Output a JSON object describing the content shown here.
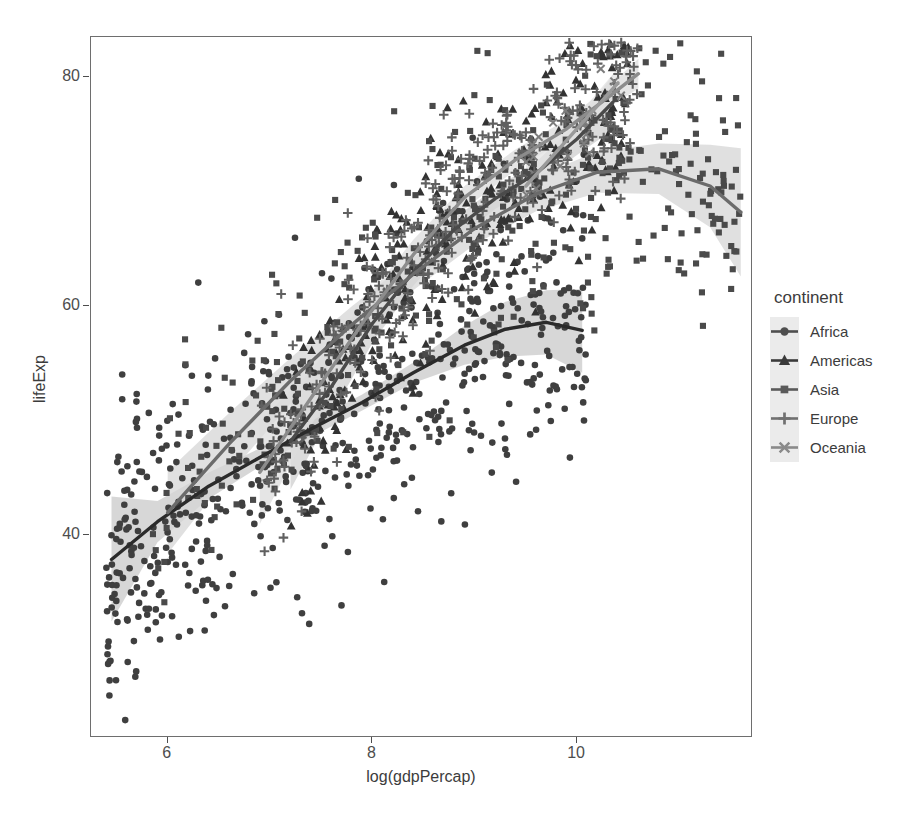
{
  "chart_data": {
    "type": "scatter",
    "title": "",
    "xlabel": "log(gdpPercap)",
    "ylabel": "lifeExp",
    "xlim": [
      5.25,
      11.7
    ],
    "ylim": [
      22.5,
      83.5
    ],
    "xticks": [
      6,
      8,
      10
    ],
    "yticks": [
      40,
      60,
      80
    ],
    "grid": false,
    "legend": {
      "title": "continent",
      "position": "right",
      "entries": [
        {
          "label": "Africa",
          "shape": "circle",
          "color": "#4f4f4f"
        },
        {
          "label": "Americas",
          "shape": "triangle",
          "color": "#3a3a3a"
        },
        {
          "label": "Asia",
          "shape": "square",
          "color": "#5a5a5a"
        },
        {
          "label": "Europe",
          "shape": "plus",
          "color": "#707070"
        },
        {
          "label": "Oceania",
          "shape": "cross",
          "color": "#8a8a8a"
        }
      ]
    },
    "series": [
      {
        "name": "Africa",
        "shape": "circle",
        "color": "#3f3f3f",
        "smooth_color": "#2b2b2b",
        "ribbon_color": "#c9c9c9",
        "smooth_x": [
          5.45,
          5.9,
          6.4,
          6.9,
          7.4,
          7.9,
          8.4,
          8.9,
          9.3,
          9.7,
          10.05
        ],
        "smooth_y": [
          37.9,
          41.2,
          44.3,
          46.8,
          49.3,
          51.6,
          54.2,
          56.6,
          58.0,
          58.6,
          57.9
        ],
        "ribbon_lo": [
          32.5,
          39.4,
          43.2,
          46.0,
          48.6,
          50.9,
          53.3,
          54.9,
          55.6,
          55.8,
          54.2
        ],
        "ribbon_hi": [
          43.4,
          43.0,
          45.5,
          47.6,
          50.0,
          52.3,
          55.1,
          58.3,
          60.4,
          61.4,
          61.5
        ]
      },
      {
        "name": "Americas",
        "shape": "triangle",
        "color": "#333333",
        "smooth_color": "#4a4a4a",
        "ribbon_color": "#cfcfcf",
        "smooth_x": [
          7.2,
          7.6,
          8.0,
          8.4,
          8.8,
          9.2,
          9.6,
          10.0,
          10.35
        ],
        "smooth_y": [
          48.2,
          53.0,
          58.5,
          63.0,
          66.7,
          69.4,
          71.6,
          74.6,
          77.8
        ],
        "ribbon_lo": [
          44.0,
          50.6,
          56.8,
          61.8,
          65.7,
          68.5,
          70.6,
          73.2,
          75.4
        ],
        "ribbon_hi": [
          52.4,
          55.4,
          60.2,
          64.2,
          67.7,
          70.3,
          72.6,
          76.0,
          80.2
        ]
      },
      {
        "name": "Asia",
        "shape": "square",
        "color": "#4a4a4a",
        "smooth_color": "#6b6b6b",
        "ribbon_color": "#d6d6d6",
        "smooth_x": [
          6.0,
          6.6,
          7.2,
          7.8,
          8.4,
          9.0,
          9.6,
          10.2,
          10.8,
          11.3,
          11.6
        ],
        "smooth_y": [
          42.0,
          48.0,
          53.5,
          58.4,
          62.8,
          66.8,
          69.8,
          71.7,
          72.0,
          70.5,
          68.2
        ],
        "ribbon_lo": [
          38.4,
          45.3,
          51.5,
          56.8,
          61.4,
          65.4,
          68.3,
          69.9,
          69.8,
          66.9,
          62.6
        ],
        "ribbon_hi": [
          45.6,
          50.7,
          55.5,
          60.0,
          64.2,
          68.2,
          71.3,
          73.5,
          74.2,
          74.1,
          73.8
        ]
      },
      {
        "name": "Europe",
        "shape": "plus",
        "color": "#606060",
        "smooth_color": "#8c8c8c",
        "ribbon_color": "#dcdcdc",
        "smooth_x": [
          6.9,
          7.4,
          7.9,
          8.4,
          8.9,
          9.4,
          9.9,
          10.3,
          10.6
        ],
        "smooth_y": [
          45.5,
          52.0,
          58.5,
          64.5,
          69.5,
          72.8,
          75.5,
          78.2,
          80.3
        ],
        "ribbon_lo": [
          41.0,
          49.6,
          56.8,
          63.2,
          68.5,
          71.9,
          74.7,
          77.3,
          79.0
        ],
        "ribbon_hi": [
          50.0,
          54.4,
          60.2,
          65.8,
          70.5,
          73.7,
          76.3,
          79.1,
          81.6
        ]
      },
      {
        "name": "Oceania",
        "shape": "cross",
        "color": "#7d7d7d",
        "smooth_color": "#9a9a9a",
        "ribbon_color": "#e2e2e2",
        "smooth_x": [
          9.5,
          9.8,
          10.1,
          10.4
        ],
        "smooth_y": [
          70.5,
          73.5,
          76.5,
          79.5
        ],
        "ribbon_lo": [
          68.6,
          72.2,
          75.4,
          78.2
        ],
        "ribbon_hi": [
          72.4,
          74.8,
          77.6,
          80.8
        ]
      }
    ],
    "n_points": 1704,
    "point_summary": "Each point is one country-year observation from the Gapminder panel (142 countries x 12 years); log GDP per capita on x, life expectancy on y, continent encoded by point shape."
  },
  "axes": {
    "x_title": "log(gdpPercap)",
    "y_title": "lifeExp",
    "x_tick_labels": [
      "6",
      "8",
      "10"
    ],
    "y_tick_labels": [
      "40",
      "60",
      "80"
    ]
  },
  "legend": {
    "title": "continent",
    "labels": [
      "Africa",
      "Americas",
      "Asia",
      "Europe",
      "Oceania"
    ]
  },
  "theme": {
    "panel_border": "#6e6e6e",
    "background": "#ffffff",
    "text_color": "#3c3c3c",
    "tick_color": "#4d4d4d",
    "legend_key_bg": "#ebebeb"
  }
}
